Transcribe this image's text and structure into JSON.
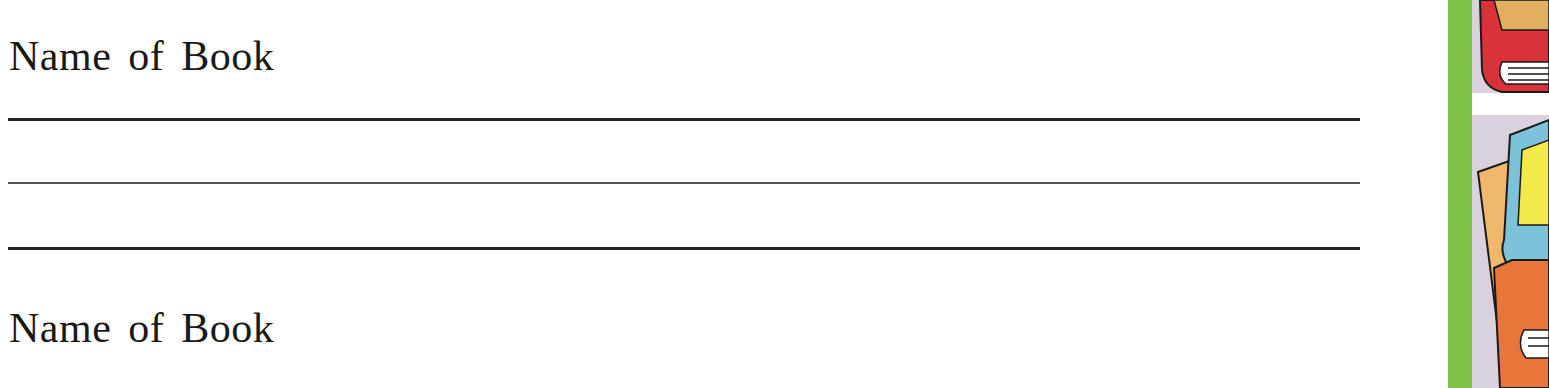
{
  "worksheet": {
    "entries": [
      {
        "label": "Name of Book"
      },
      {
        "label": "Name of Book"
      }
    ],
    "writing_lines": 3
  },
  "decoration": {
    "border_color": "#7ec24a",
    "illustration": "stack-of-books-icon"
  }
}
